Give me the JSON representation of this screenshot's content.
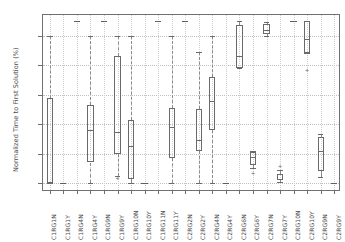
{
  "chart_data": {
    "type": "box",
    "title": "",
    "xlabel": "",
    "ylabel": "Normalized Time to First Solution (%)",
    "ylim": [
      -6,
      114
    ],
    "yticks": [
      0,
      20,
      40,
      60,
      80,
      100
    ],
    "ytick_labels": [
      "0",
      "20",
      "40",
      "60",
      "80",
      "100"
    ],
    "grid": true,
    "legend": "none",
    "categories": [
      "C1RG1N",
      "C1RG1Y",
      "C1RG4N",
      "C1RG4Y",
      "C1RG9N",
      "C1RG9Y",
      "C1RG10N",
      "C1RG10Y",
      "C1RG11N",
      "C1RG11Y",
      "C2RG2N",
      "C2RG2Y",
      "C2RG4N",
      "C2RG4Y",
      "C2RG6N",
      "C2RG6Y",
      "C2RG7N",
      "C2RG7Y",
      "C2RG10N",
      "C2RG10Y",
      "C2RG9N",
      "C2RG9Y"
    ],
    "boxes": [
      {
        "category": "C1RG1N",
        "whisker_low": 0,
        "q1": 0,
        "median": 0,
        "q3": 58,
        "whisker_high": 100,
        "fliers": [],
        "degenerate": false
      },
      {
        "category": "C1RG1Y",
        "whisker_low": 0,
        "q1": 0,
        "median": 0,
        "q3": 0,
        "whisker_high": 0,
        "fliers": [],
        "degenerate": true
      },
      {
        "category": "C1RG4N",
        "whisker_low": 110,
        "q1": 110,
        "median": 110,
        "q3": 110,
        "whisker_high": 110,
        "fliers": [],
        "degenerate": true
      },
      {
        "category": "C1RG4Y",
        "whisker_low": 0,
        "q1": 14,
        "median": 36,
        "q3": 53,
        "whisker_high": 100,
        "fliers": [],
        "degenerate": false
      },
      {
        "category": "C1RG9N",
        "whisker_low": 110,
        "q1": 110,
        "median": 110,
        "q3": 110,
        "whisker_high": 110,
        "fliers": [],
        "degenerate": true
      },
      {
        "category": "C1RG9Y",
        "whisker_low": 5,
        "q1": 20,
        "median": 35,
        "q3": 86,
        "whisker_high": 100,
        "fliers": [
          3
        ],
        "degenerate": false
      },
      {
        "category": "C1RG10N",
        "whisker_low": 0,
        "q1": 3,
        "median": 25,
        "q3": 43,
        "whisker_high": 100,
        "fliers": [],
        "degenerate": false
      },
      {
        "category": "C1RG10Y",
        "whisker_low": 0,
        "q1": 0,
        "median": 0,
        "q3": 0,
        "whisker_high": 0,
        "fliers": [],
        "degenerate": true
      },
      {
        "category": "C1RG11N",
        "whisker_low": 110,
        "q1": 110,
        "median": 110,
        "q3": 110,
        "whisker_high": 110,
        "fliers": [],
        "degenerate": true
      },
      {
        "category": "C1RG11Y",
        "whisker_low": 0,
        "q1": 17,
        "median": 38,
        "q3": 51,
        "whisker_high": 100,
        "fliers": [],
        "degenerate": false
      },
      {
        "category": "C2RG2N",
        "whisker_low": 110,
        "q1": 110,
        "median": 110,
        "q3": 110,
        "whisker_high": 110,
        "fliers": [],
        "degenerate": true
      },
      {
        "category": "C2RG2Y",
        "whisker_low": 0,
        "q1": 22,
        "median": 29,
        "q3": 50,
        "whisker_high": 89,
        "fliers": [],
        "degenerate": false
      },
      {
        "category": "C2RG4N",
        "whisker_low": 0,
        "q1": 36,
        "median": 56,
        "q3": 72,
        "whisker_high": 100,
        "fliers": [],
        "degenerate": false
      },
      {
        "category": "C2RG4Y",
        "whisker_low": 0,
        "q1": 0,
        "median": 0,
        "q3": 0,
        "whisker_high": 0,
        "fliers": [],
        "degenerate": true
      },
      {
        "category": "C2RG6N",
        "whisker_low": 78,
        "q1": 78,
        "median": 86,
        "q3": 107,
        "whisker_high": 110,
        "fliers": [],
        "degenerate": false
      },
      {
        "category": "C2RG6Y",
        "whisker_low": 10,
        "q1": 12,
        "median": 18,
        "q3": 21,
        "whisker_high": 22,
        "fliers": [
          6
        ],
        "degenerate": false
      },
      {
        "category": "C2RG7N",
        "whisker_low": 100,
        "q1": 101,
        "median": 104,
        "q3": 108,
        "whisker_high": 109,
        "fliers": [],
        "degenerate": false
      },
      {
        "category": "C2RG7Y",
        "whisker_low": 1,
        "q1": 2,
        "median": 3,
        "q3": 6,
        "whisker_high": 9,
        "fliers": [
          11
        ],
        "degenerate": false
      },
      {
        "category": "C2RG10N",
        "whisker_low": 110,
        "q1": 110,
        "median": 110,
        "q3": 110,
        "whisker_high": 110,
        "fliers": [],
        "degenerate": true
      },
      {
        "category": "C2RG10Y",
        "whisker_low": 88,
        "q1": 88,
        "median": 98,
        "q3": 110,
        "whisker_high": 110,
        "fliers": [
          76
        ],
        "degenerate": false
      },
      {
        "category": "C2RG9N",
        "whisker_low": 4,
        "q1": 8,
        "median": 22,
        "q3": 31,
        "whisker_high": 33,
        "fliers": [],
        "degenerate": false
      },
      {
        "category": "C2RG9Y",
        "whisker_low": 0,
        "q1": 0,
        "median": 0,
        "q3": 0,
        "whisker_high": 0,
        "fliers": [],
        "degenerate": true
      }
    ]
  }
}
